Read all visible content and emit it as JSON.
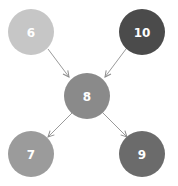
{
  "diagram": {
    "type": "directed-graph",
    "nodes": [
      {
        "id": "n6",
        "label": "6",
        "cx": 31,
        "cy": 32,
        "r": 23,
        "color": "#c6c6c6"
      },
      {
        "id": "n10",
        "label": "10",
        "cx": 142,
        "cy": 32,
        "r": 23,
        "color": "#4b4b4b"
      },
      {
        "id": "n8",
        "label": "8",
        "cx": 87,
        "cy": 96,
        "r": 23,
        "color": "#8a8a8a"
      },
      {
        "id": "n7",
        "label": "7",
        "cx": 31,
        "cy": 154,
        "r": 23,
        "color": "#9b9b9b"
      },
      {
        "id": "n9",
        "label": "9",
        "cx": 142,
        "cy": 154,
        "r": 23,
        "color": "#6b6b6b"
      }
    ],
    "edges": [
      {
        "from": "6",
        "to": "8"
      },
      {
        "from": "10",
        "to": "8"
      },
      {
        "from": "8",
        "to": "7"
      },
      {
        "from": "8",
        "to": "9"
      }
    ],
    "edge_color": "#9a9a9a"
  }
}
